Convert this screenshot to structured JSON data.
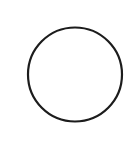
{
  "canvas": {
    "width": 133,
    "height": 141,
    "background": "#ffffff"
  },
  "shape": {
    "type": "circle",
    "icon": "circle-outline-icon",
    "cx": 75,
    "cy": 74.5,
    "r": 47,
    "stroke": "#1c1c1c",
    "stroke_width": 2.2,
    "fill": "none"
  }
}
